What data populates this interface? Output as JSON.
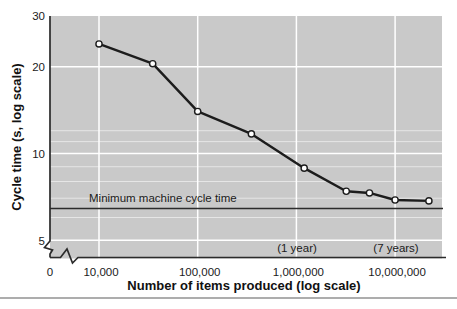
{
  "figure": {
    "y_axis": {
      "title": "Cycle time (s, log scale)",
      "ticks": [
        {
          "value": 30,
          "label": "30"
        },
        {
          "value": 20,
          "label": "20"
        },
        {
          "value": 10,
          "label": "10"
        },
        {
          "value": 5,
          "label": "5"
        }
      ]
    },
    "x_axis": {
      "title": "Number of items produced (log scale)",
      "origin_label": "0",
      "ticks": [
        {
          "value": 10000,
          "label": "10,000"
        },
        {
          "value": 100000,
          "label": "100,000"
        },
        {
          "value": 1000000,
          "label": "1,000,000"
        },
        {
          "value": 10000000,
          "label": "10,000,000"
        }
      ]
    },
    "min_line": {
      "label": "Minimum machine cycle time",
      "value": 6.45
    },
    "annotations": [
      {
        "text": "(1 year)",
        "x": 1000000
      },
      {
        "text": "(7 years)",
        "x": 10000000
      }
    ],
    "colors": {
      "plot_bg": "#c9c9c9",
      "grid": "#ffffff",
      "line": "#1c1c1c",
      "marker_fill": "#ffffff",
      "axis": "#2b2b2b",
      "text": "#1b1b1b",
      "bottom_rule": "#adadad"
    }
  },
  "chart_data": {
    "type": "line",
    "title": "",
    "xlabel": "Number of items produced (log scale)",
    "ylabel": "Cycle time (s, log scale)",
    "x_scale": "log",
    "y_scale": "log",
    "x": [
      10000,
      35000,
      100000,
      350000,
      1200000,
      3200000,
      5500000,
      10000000,
      22000000
    ],
    "y": [
      24,
      20.5,
      14,
      11.7,
      8.9,
      7.4,
      7.3,
      6.9,
      6.85
    ],
    "xlim": [
      10000,
      30000000
    ],
    "ylim": [
      4.3,
      30
    ],
    "grid": "on",
    "legend": "none",
    "minor_y_gridlines": [
      6,
      7,
      8,
      9,
      11,
      12
    ],
    "reference_line": {
      "label": "Minimum machine cycle time",
      "y": 6.45
    },
    "annotations": [
      {
        "text": "(1 year)",
        "x": 1000000
      },
      {
        "text": "(7 years)",
        "x": 10000000
      }
    ]
  }
}
